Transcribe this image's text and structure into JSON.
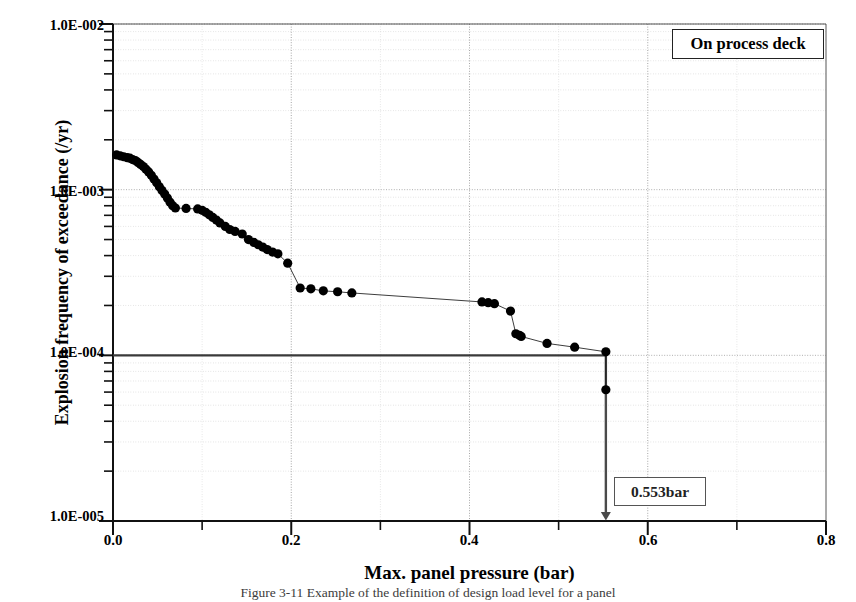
{
  "figure": {
    "legend_label": "On process deck",
    "annotation_label": "0.553bar",
    "caption": "Figure 3-11  Example of the definition of design load level for a panel"
  },
  "axes": {
    "x_title": "Max. panel pressure (bar)",
    "y_title": "Explosion frequency of exceedance (/yr)",
    "x_ticks": [
      "0.0",
      "0.2",
      "0.4",
      "0.6",
      "0.8"
    ],
    "y_ticks": [
      "1.0E-002",
      "1.0E-003",
      "1.0E-004",
      "1.0E-005"
    ]
  },
  "chart_data": {
    "type": "scatter",
    "title": "",
    "subtitle": "",
    "xlabel": "Max. panel pressure (bar)",
    "ylabel": "Explosion frequency of exceedance (/yr)",
    "xlim": [
      0.0,
      0.8
    ],
    "ylim": [
      1e-05,
      0.01
    ],
    "yscale": "log",
    "xscale": "linear",
    "grid": true,
    "legend_position": "top-right",
    "legend_entries": [
      "On process deck"
    ],
    "x_major_ticks": [
      0.0,
      0.2,
      0.4,
      0.6,
      0.8
    ],
    "x_minor_tick_step": 0.1,
    "y_major_ticks": [
      0.01,
      0.001,
      0.0001,
      1e-05
    ],
    "annotations": [
      {
        "text": "0.553bar",
        "x": 0.553,
        "y": 1e-05,
        "type": "vertical-arrow-from-reference-line",
        "arrow_from_y": 0.0001,
        "arrow_to_y": 1e-05
      }
    ],
    "reference_lines": [
      {
        "orientation": "horizontal",
        "y": 0.0001,
        "label": "",
        "x_start": 0.0,
        "x_end": 0.553
      }
    ],
    "series": [
      {
        "name": "On process deck",
        "marker": "filled-circle",
        "line": true,
        "color": "#000000",
        "points": [
          [
            0.004,
            0.00162
          ],
          [
            0.008,
            0.0016
          ],
          [
            0.012,
            0.00158
          ],
          [
            0.016,
            0.00156
          ],
          [
            0.019,
            0.00155
          ],
          [
            0.022,
            0.00152
          ],
          [
            0.025,
            0.0015
          ],
          [
            0.028,
            0.00146
          ],
          [
            0.031,
            0.00142
          ],
          [
            0.034,
            0.00138
          ],
          [
            0.037,
            0.00133
          ],
          [
            0.04,
            0.00128
          ],
          [
            0.043,
            0.00122
          ],
          [
            0.046,
            0.00116
          ],
          [
            0.049,
            0.0011
          ],
          [
            0.052,
            0.00104
          ],
          [
            0.055,
            0.00099
          ],
          [
            0.058,
            0.00094
          ],
          [
            0.061,
            0.00089
          ],
          [
            0.064,
            0.00084
          ],
          [
            0.067,
            0.0008
          ],
          [
            0.07,
            0.000775
          ],
          [
            0.082,
            0.00077
          ],
          [
            0.095,
            0.000765
          ],
          [
            0.1,
            0.00075
          ],
          [
            0.104,
            0.00073
          ],
          [
            0.108,
            0.000705
          ],
          [
            0.112,
            0.00068
          ],
          [
            0.116,
            0.000655
          ],
          [
            0.12,
            0.00063
          ],
          [
            0.126,
            0.0006
          ],
          [
            0.131,
            0.000575
          ],
          [
            0.137,
            0.00056
          ],
          [
            0.145,
            0.00054
          ],
          [
            0.152,
            0.0005
          ],
          [
            0.158,
            0.00048
          ],
          [
            0.163,
            0.000465
          ],
          [
            0.168,
            0.00045
          ],
          [
            0.173,
            0.000435
          ],
          [
            0.179,
            0.00042
          ],
          [
            0.185,
            0.00041
          ],
          [
            0.196,
            0.00036
          ],
          [
            0.21,
            0.000255
          ],
          [
            0.222,
            0.000252
          ],
          [
            0.236,
            0.000245
          ],
          [
            0.252,
            0.000242
          ],
          [
            0.268,
            0.000238
          ],
          [
            0.414,
            0.00021
          ],
          [
            0.421,
            0.000208
          ],
          [
            0.428,
            0.000205
          ],
          [
            0.446,
            0.000185
          ],
          [
            0.452,
            0.000135
          ],
          [
            0.456,
            0.000132
          ],
          [
            0.458,
            0.00013
          ],
          [
            0.487,
            0.000118
          ],
          [
            0.518,
            0.000112
          ],
          [
            0.553,
            0.000105
          ],
          [
            0.553,
            6.2e-05
          ]
        ]
      }
    ]
  }
}
